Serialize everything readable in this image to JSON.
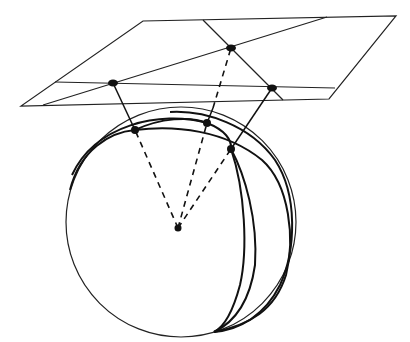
{
  "diagram": {
    "plane": {
      "corners": [
        [
          143,
          21
        ],
        [
          396,
          16
        ],
        [
          329,
          99
        ],
        [
          21,
          106
        ]
      ],
      "lines": [
        {
          "name": "plane-line-diagonal",
          "from": [
            43,
            105
          ],
          "to": [
            327,
            17
          ]
        },
        {
          "name": "plane-line-horizontal",
          "from": [
            55,
            82
          ],
          "to": [
            335,
            88
          ]
        },
        {
          "name": "plane-line-steep",
          "from": [
            203,
            20
          ],
          "to": [
            283,
            100
          ]
        }
      ],
      "points": [
        [
          113,
          83
        ],
        [
          231,
          48
        ],
        [
          272,
          88
        ]
      ]
    },
    "sphere": {
      "center": [
        181,
        222
      ],
      "radius": 115,
      "center_point": [
        178,
        228
      ],
      "intersection_points": [
        [
          135,
          130
        ],
        [
          207,
          123
        ],
        [
          231,
          149
        ]
      ]
    },
    "projection_rays": [
      {
        "from": [
          178,
          228
        ],
        "via": [
          135,
          130
        ],
        "to": [
          113,
          83
        ]
      },
      {
        "from": [
          178,
          228
        ],
        "via": [
          207,
          123
        ],
        "to": [
          231,
          48
        ]
      },
      {
        "from": [
          178,
          228
        ],
        "via": [
          231,
          149
        ],
        "to": [
          272,
          88
        ]
      }
    ],
    "colors": {
      "line": "#111111",
      "background": "#ffffff"
    }
  }
}
